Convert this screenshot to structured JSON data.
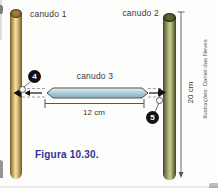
{
  "figure": {
    "caption": "Figura 10.30.",
    "credit": "Ilustrações: Daniel das Neves",
    "labels": {
      "straw1": "canudo 1",
      "straw2": "canudo 2",
      "straw3": "canudo 3"
    },
    "measurements": {
      "straw3_length": "12 cm",
      "straw2_length": "20 cm"
    },
    "markers": {
      "left_knot": "4",
      "right_knot": "5"
    },
    "colors": {
      "straw1": "#d9ba7c",
      "straw2": "#aab072",
      "straw3": "#a9ccd9",
      "caption_text": "#2f3490",
      "marker_bg": "#111111",
      "dashed_guide": "#8a8a8a"
    }
  }
}
